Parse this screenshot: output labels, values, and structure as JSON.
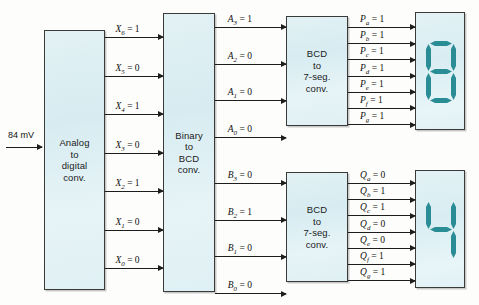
{
  "diagram": {
    "accent_color": "#2a8d95",
    "block_fill": "#dcf0f4",
    "line_color": "#1d1d1d"
  },
  "input": {
    "label": "84 mV"
  },
  "blocks": [
    {
      "id": "adc",
      "lines": [
        "Analog",
        "to",
        "digital",
        "conv."
      ]
    },
    {
      "id": "bin2bcd",
      "lines": [
        "Binary",
        "to",
        "BCD",
        "conv."
      ]
    },
    {
      "id": "bcd7seg_a",
      "lines": [
        "BCD",
        "to",
        "7-seg.",
        "conv."
      ]
    },
    {
      "id": "bcd7seg_b",
      "lines": [
        "BCD",
        "to",
        "7-seg.",
        "conv."
      ]
    }
  ],
  "signals": {
    "x_bus": [
      {
        "name": "X",
        "sub": "6",
        "value": "1"
      },
      {
        "name": "X",
        "sub": "5",
        "value": "0"
      },
      {
        "name": "X",
        "sub": "4",
        "value": "1"
      },
      {
        "name": "X",
        "sub": "3",
        "value": "0"
      },
      {
        "name": "X",
        "sub": "2",
        "value": "1"
      },
      {
        "name": "X",
        "sub": "1",
        "value": "0"
      },
      {
        "name": "X",
        "sub": "0",
        "value": "0"
      }
    ],
    "a_bus": [
      {
        "name": "A",
        "sub": "3",
        "value": "1"
      },
      {
        "name": "A",
        "sub": "2",
        "value": "0"
      },
      {
        "name": "A",
        "sub": "1",
        "value": "0"
      },
      {
        "name": "A",
        "sub": "0",
        "value": "0"
      }
    ],
    "b_bus": [
      {
        "name": "B",
        "sub": "3",
        "value": "0"
      },
      {
        "name": "B",
        "sub": "2",
        "value": "1"
      },
      {
        "name": "B",
        "sub": "1",
        "value": "0"
      },
      {
        "name": "B",
        "sub": "0",
        "value": "0"
      }
    ],
    "p_bus": [
      {
        "name": "P",
        "sub": "a",
        "value": "1"
      },
      {
        "name": "P",
        "sub": "b",
        "value": "1"
      },
      {
        "name": "P",
        "sub": "c",
        "value": "1"
      },
      {
        "name": "P",
        "sub": "d",
        "value": "1"
      },
      {
        "name": "P",
        "sub": "e",
        "value": "1"
      },
      {
        "name": "P",
        "sub": "f",
        "value": "1"
      },
      {
        "name": "P",
        "sub": "g",
        "value": "1"
      }
    ],
    "q_bus": [
      {
        "name": "Q",
        "sub": "a",
        "value": "0"
      },
      {
        "name": "Q",
        "sub": "b",
        "value": "1"
      },
      {
        "name": "Q",
        "sub": "c",
        "value": "1"
      },
      {
        "name": "Q",
        "sub": "d",
        "value": "0"
      },
      {
        "name": "Q",
        "sub": "e",
        "value": "0"
      },
      {
        "name": "Q",
        "sub": "f",
        "value": "1"
      },
      {
        "name": "Q",
        "sub": "g",
        "value": "1"
      }
    ]
  },
  "displays": [
    {
      "id": "display-top",
      "digit": "8",
      "segments": {
        "a": 1,
        "b": 1,
        "c": 1,
        "d": 1,
        "e": 1,
        "f": 1,
        "g": 1
      }
    },
    {
      "id": "display-bottom",
      "digit": "4",
      "segments": {
        "a": 0,
        "b": 1,
        "c": 1,
        "d": 0,
        "e": 0,
        "f": 1,
        "g": 1
      }
    }
  ]
}
